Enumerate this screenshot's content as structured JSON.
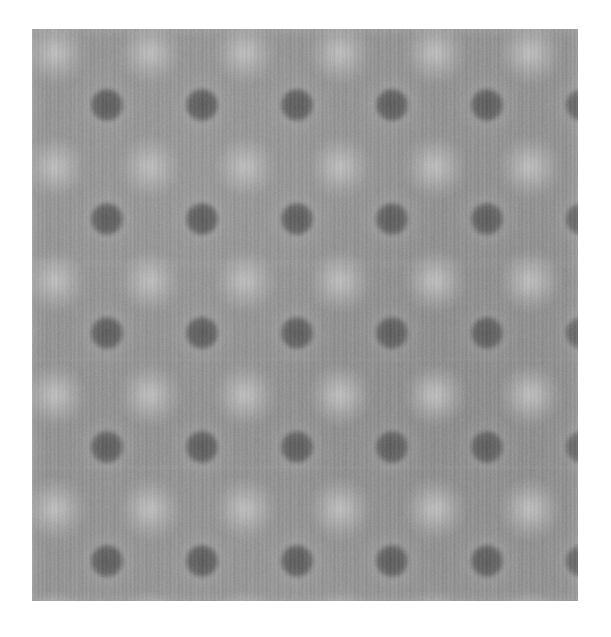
{
  "image": {
    "kind": "grayscale-lattice-micrograph",
    "title": "Atomic-resolution lattice image",
    "canvas": {
      "width": 611,
      "height": 637,
      "background": "#ffffff"
    },
    "panel": {
      "left": 32,
      "top": 29,
      "width": 546,
      "height": 572,
      "background_color": "#919191"
    },
    "colors": {
      "page_background": "#ffffff",
      "field_mid_gray": "#919191",
      "field_light_gray": "#9c9c9c",
      "field_dark_gray": "#858585",
      "bright_site": "#b2b2b2",
      "bright_site_core": "#bdbdbd",
      "dark_site": "#636363",
      "dark_site_core": "#5c5c5c",
      "halo_ring": "#9a9a9a"
    },
    "texture": {
      "scanline_direction": "vertical",
      "scanline_period_px": 4,
      "band_period_px": 11,
      "global_blur_px": 1.6,
      "noise_opacity": 0.1
    },
    "lattice": {
      "description": "Two interpenetrating square sublattices of atomic columns",
      "dark_sublattice": {
        "label": "dark-site-sublattice",
        "count_x": 5,
        "count_y": 5,
        "spacing_x_px": 95,
        "spacing_y_px": 114,
        "origin_x_px": 75,
        "origin_y_px": 76,
        "radius_px": 14,
        "softness_px": 3,
        "halo_radius_px": 34,
        "columns_x": [
          75,
          170,
          265,
          360,
          455
        ],
        "rows_y": [
          76,
          190,
          304,
          418,
          532
        ]
      },
      "bright_sublattice": {
        "label": "bright-site-sublattice",
        "count_x": 6,
        "count_y": 6,
        "spacing_x_px": 95,
        "spacing_y_px": 114,
        "origin_x_px": 23,
        "origin_y_px": 24,
        "radius_px": 16,
        "softness_px": 7,
        "columns_x": [
          23,
          118,
          213,
          308,
          403,
          498
        ],
        "rows_y": [
          24,
          138,
          252,
          366,
          480,
          552
        ]
      }
    },
    "row_artifact_y_px": [
      232,
      236,
      330,
      438
    ]
  },
  "chart_data": {
    "type": "heatmap",
    "subtitle": "",
    "xlabel": "",
    "ylabel": "",
    "colormap": "grayscale",
    "value_range": [
      92,
      189
    ],
    "legend": [],
    "annotations": [],
    "grid": false,
    "series": [
      {
        "name": "dark-site-sublattice",
        "marker": "filled-circle",
        "intensity": 99,
        "radius_px": 14,
        "x": [
          75,
          170,
          265,
          360,
          455
        ],
        "y": [
          76,
          190,
          304,
          418,
          532
        ]
      },
      {
        "name": "bright-site-sublattice",
        "marker": "soft-disc",
        "intensity": 178,
        "radius_px": 16,
        "x": [
          23,
          118,
          213,
          308,
          403,
          498
        ],
        "y": [
          24,
          138,
          252,
          366,
          480,
          552
        ]
      }
    ],
    "background_intensity": 145
  }
}
